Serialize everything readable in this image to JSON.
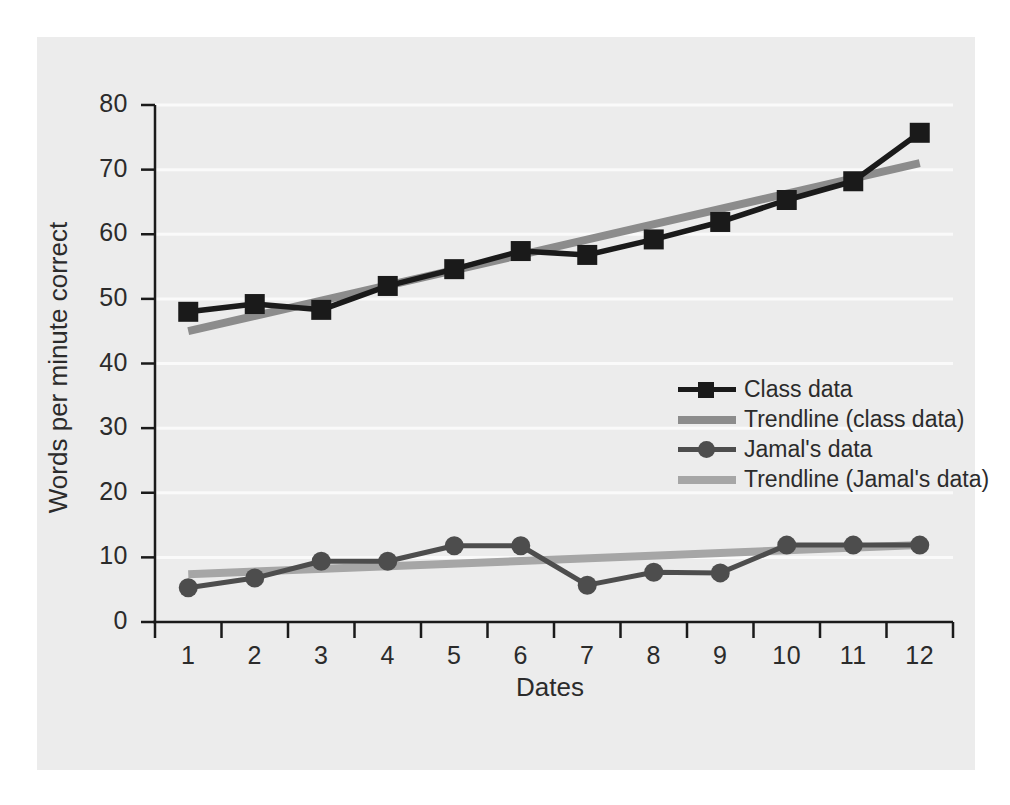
{
  "chart_data": {
    "type": "line",
    "title": "",
    "xlabel": "Dates",
    "ylabel": "Words per minute correct",
    "x": [
      1,
      2,
      3,
      4,
      5,
      6,
      7,
      8,
      9,
      10,
      11,
      12
    ],
    "xticklabels": [
      "1",
      "2",
      "3",
      "4",
      "5",
      "6",
      "7",
      "8",
      "9",
      "10",
      "11",
      "12"
    ],
    "yticklabels": [
      "0",
      "10",
      "20",
      "30",
      "40",
      "50",
      "60",
      "70",
      "80"
    ],
    "yticks": [
      0,
      10,
      20,
      30,
      40,
      50,
      60,
      70,
      80
    ],
    "ylim": [
      0,
      85
    ],
    "xlim": [
      0.5,
      12.5
    ],
    "grid": "horizontal",
    "legend_position": "center-right",
    "series": [
      {
        "name": "Class data",
        "kind": "line-marker",
        "marker": "square",
        "color": "#1a1a1a",
        "values": [
          48.0,
          49.2,
          48.3,
          52.0,
          54.6,
          57.4,
          56.8,
          59.2,
          61.9,
          65.3,
          68.2,
          75.7
        ]
      },
      {
        "name": "Trendline (class data)",
        "kind": "trendline",
        "color": "#8c8c8c",
        "endpoints": [
          45.0,
          71.0
        ]
      },
      {
        "name": "Jamal's data",
        "kind": "line-marker",
        "marker": "circle",
        "color": "#4d4d4d",
        "values": [
          5.3,
          6.8,
          9.4,
          9.4,
          11.8,
          11.8,
          5.7,
          7.7,
          7.6,
          11.9,
          11.9,
          11.9
        ]
      },
      {
        "name": "Trendline (Jamal's data)",
        "kind": "trendline",
        "color": "#a6a6a6",
        "endpoints": [
          7.4,
          11.9
        ]
      }
    ]
  },
  "legend": {
    "entries": [
      {
        "label": "Class data",
        "key": "line-square-marker",
        "color": "#1a1a1a"
      },
      {
        "label": "Trendline (class data)",
        "key": "thick-line",
        "color": "#8c8c8c"
      },
      {
        "label": "Jamal's data",
        "key": "line-circle-marker",
        "color": "#4d4d4d"
      },
      {
        "label": "Trendline (Jamal's data)",
        "key": "thick-line",
        "color": "#a6a6a6"
      }
    ]
  },
  "colors": {
    "panel_background": "#ececec",
    "figure_background": "#ffffff",
    "gridline": "#fafafa",
    "axis": "#1a1a1a",
    "text": "#2b2b2b"
  }
}
